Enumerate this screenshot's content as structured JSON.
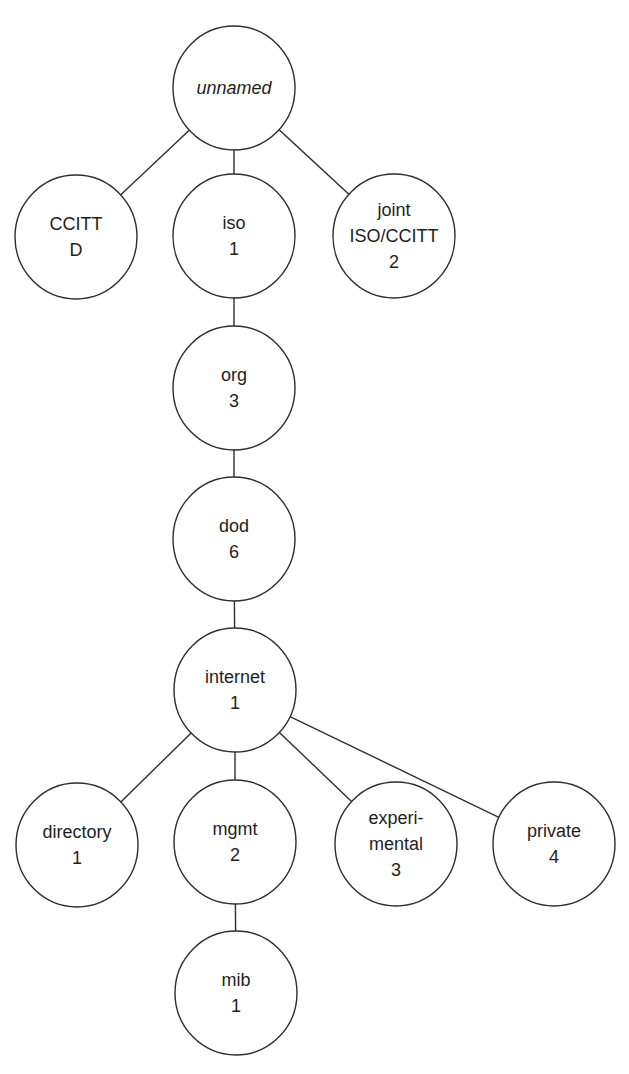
{
  "diagram": {
    "type": "tree",
    "style": {
      "line_color": "#2e2e2e",
      "text_color": "#1e1e1e",
      "background": "#ffffff",
      "node_rx": 61,
      "node_ry": 62,
      "line_height": 26
    },
    "nodes": [
      {
        "id": "unnamed",
        "lines": [
          "unnamed"
        ],
        "italic": true,
        "cx": 234,
        "cy": 88
      },
      {
        "id": "ccitt",
        "lines": [
          "CCITT",
          "D"
        ],
        "italic": false,
        "cx": 76,
        "cy": 237
      },
      {
        "id": "iso",
        "lines": [
          "iso",
          "1"
        ],
        "italic": false,
        "cx": 234,
        "cy": 236
      },
      {
        "id": "joint",
        "lines": [
          "joint",
          "ISO/CCITT",
          "2"
        ],
        "italic": false,
        "cx": 394,
        "cy": 236
      },
      {
        "id": "org",
        "lines": [
          "org",
          "3"
        ],
        "italic": false,
        "cx": 234,
        "cy": 388
      },
      {
        "id": "dod",
        "lines": [
          "dod",
          "6"
        ],
        "italic": false,
        "cx": 234,
        "cy": 539
      },
      {
        "id": "internet",
        "lines": [
          "internet",
          "1"
        ],
        "italic": false,
        "cx": 235,
        "cy": 690
      },
      {
        "id": "directory",
        "lines": [
          "directory",
          "1"
        ],
        "italic": false,
        "cx": 77,
        "cy": 845
      },
      {
        "id": "mgmt",
        "lines": [
          "mgmt",
          "2"
        ],
        "italic": false,
        "cx": 235,
        "cy": 842
      },
      {
        "id": "experimental",
        "lines": [
          "experi-",
          "mental",
          "3"
        ],
        "italic": false,
        "cx": 396,
        "cy": 844
      },
      {
        "id": "private",
        "lines": [
          "private",
          "4"
        ],
        "italic": false,
        "cx": 554,
        "cy": 844
      },
      {
        "id": "mib",
        "lines": [
          "mib",
          "1"
        ],
        "italic": false,
        "cx": 236,
        "cy": 993
      }
    ],
    "edges": [
      {
        "from": "unnamed",
        "to": "ccitt"
      },
      {
        "from": "unnamed",
        "to": "iso"
      },
      {
        "from": "unnamed",
        "to": "joint"
      },
      {
        "from": "iso",
        "to": "org"
      },
      {
        "from": "org",
        "to": "dod"
      },
      {
        "from": "dod",
        "to": "internet"
      },
      {
        "from": "internet",
        "to": "directory"
      },
      {
        "from": "internet",
        "to": "mgmt"
      },
      {
        "from": "internet",
        "to": "experimental"
      },
      {
        "from": "internet",
        "to": "private"
      },
      {
        "from": "mgmt",
        "to": "mib"
      }
    ]
  }
}
